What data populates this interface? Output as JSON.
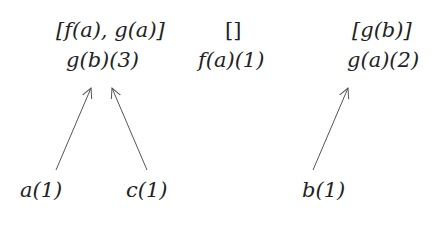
{
  "nodes": {
    "top_left_list": "[f(a), g(a)]",
    "top_left_node": "g(b)(3)",
    "top_mid_list": "[]",
    "top_mid_node": "f(a)(1)",
    "top_right_list": "[g(b)]",
    "top_right_node": "g(a)(2)",
    "leaf_a": "a(1)",
    "leaf_c": "c(1)",
    "leaf_b": "b(1)"
  },
  "edges": [
    {
      "from": "a(1)",
      "to": "g(b)(3)"
    },
    {
      "from": "c(1)",
      "to": "g(b)(3)"
    },
    {
      "from": "b(1)",
      "to": "g(a)(2)"
    }
  ],
  "colors": {
    "line": "#555555",
    "text": "#222222"
  }
}
